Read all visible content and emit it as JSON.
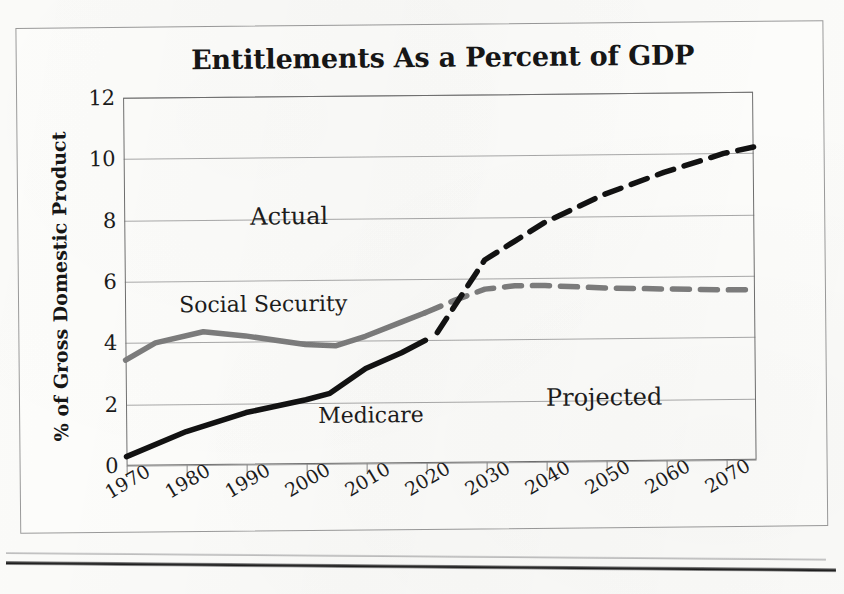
{
  "chart_data": {
    "type": "line",
    "title": "Entitlements As a Percent of GDP",
    "xlabel": "",
    "ylabel": "% of Gross Domestic Product",
    "xlim": [
      1970,
      2075
    ],
    "ylim": [
      0,
      12
    ],
    "ytick_labels": [
      "12",
      "10",
      "8",
      "6",
      "4",
      "2",
      "0"
    ],
    "ytick_values": [
      12,
      10,
      8,
      6,
      4,
      2,
      0
    ],
    "xtick_labels": [
      "1970",
      "1980",
      "1990",
      "2000",
      "2010",
      "2020",
      "2030",
      "2040",
      "2050",
      "2060",
      "2070"
    ],
    "xtick_values": [
      1970,
      1980,
      1990,
      2000,
      2010,
      2020,
      2030,
      2040,
      2050,
      2060,
      2070
    ],
    "grid": "horizontal",
    "legend": "inline-labels",
    "series": [
      {
        "name": "Social Security",
        "color": "#7d7d7d",
        "actual": {
          "x": [
            1970,
            1975,
            1983,
            1990,
            2000,
            2005,
            2010,
            2016,
            2020
          ],
          "y": [
            3.45,
            4.0,
            4.35,
            4.2,
            3.9,
            3.85,
            4.15,
            4.6,
            4.9
          ]
        },
        "projected": {
          "x": [
            2020,
            2025,
            2030,
            2035,
            2040,
            2050,
            2060,
            2070,
            2075
          ],
          "y": [
            4.9,
            5.3,
            5.65,
            5.75,
            5.75,
            5.65,
            5.6,
            5.55,
            5.55
          ]
        }
      },
      {
        "name": "Medicare",
        "color": "#121212",
        "actual": {
          "x": [
            1970,
            1980,
            1990,
            2000,
            2004,
            2010,
            2016,
            2020
          ],
          "y": [
            0.3,
            1.1,
            1.7,
            2.1,
            2.3,
            3.1,
            3.6,
            4.0
          ]
        },
        "projected": {
          "x": [
            2022,
            2030,
            2035,
            2040,
            2050,
            2060,
            2070,
            2075
          ],
          "y": [
            4.25,
            6.6,
            7.2,
            7.8,
            8.7,
            9.4,
            10.0,
            10.2
          ]
        }
      }
    ],
    "annotations": [
      {
        "text": "Actual",
        "x": 1991,
        "y": 8.0
      },
      {
        "text": "Projected",
        "x": 2040,
        "y": 2.0
      },
      {
        "text": "Social Security",
        "x": 1979,
        "y": 5.1
      },
      {
        "text": "Medicare",
        "x": 2002,
        "y": 1.45
      }
    ]
  },
  "figure": {
    "background": "#fdfdfb",
    "border_color": "#9a9a9a",
    "grid_color": "#a9a9a9",
    "axis_color": "#6f6f6f",
    "text_color": "#161616"
  }
}
